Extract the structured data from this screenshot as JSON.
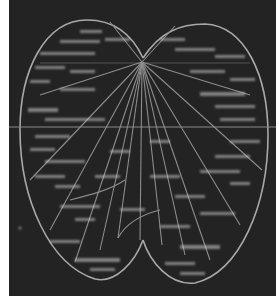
{
  "figure": {
    "kind": "leaf-shaped radial diagram",
    "background_color": "#232323",
    "line_color": "#9a9a9a",
    "label_color": "#c8c8c8",
    "labels_legible": false,
    "hub": {
      "x": 142,
      "y": 62
    },
    "horizontal_rule_y": 127
  }
}
